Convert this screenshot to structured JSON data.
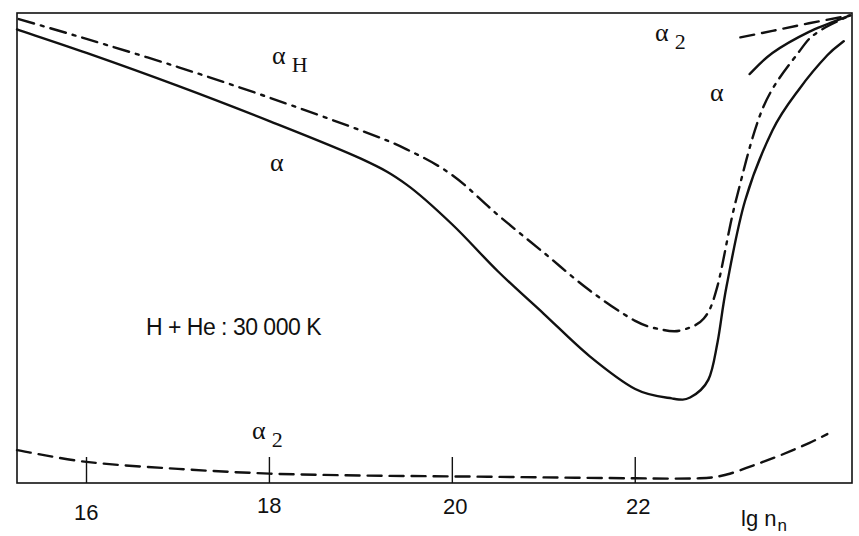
{
  "chart_data": {
    "type": "line",
    "title": "",
    "annotation": "H + He : 30 000 K",
    "xlabel": "lg n",
    "xlabel_subscript": "n",
    "ylabel": "",
    "xlim": [
      15.24,
      24.37
    ],
    "xticks": [
      16,
      18,
      20,
      22
    ],
    "ylim_note": "unlabeled y-axis; values are relative (0 = bottom axis, 1 = top frame)",
    "grid": false,
    "legend": "inline labels",
    "series": [
      {
        "name": "α_H",
        "style": "dash-dot",
        "x": [
          15.26,
          16.0,
          17.0,
          18.0,
          19.0,
          19.5,
          20.0,
          20.5,
          21.0,
          21.5,
          22.0,
          22.3,
          22.5,
          22.75,
          22.9,
          23.1,
          23.4,
          23.8,
          24.0,
          24.35
        ],
        "y": [
          0.987,
          0.945,
          0.885,
          0.82,
          0.75,
          0.71,
          0.655,
          0.57,
          0.49,
          0.41,
          0.345,
          0.326,
          0.325,
          0.35,
          0.42,
          0.6,
          0.8,
          0.92,
          0.96,
          0.995
        ]
      },
      {
        "name": "α",
        "style": "solid",
        "x": [
          15.24,
          16.0,
          17.0,
          18.0,
          19.0,
          19.5,
          20.0,
          20.5,
          21.0,
          21.5,
          22.0,
          22.4,
          22.6,
          22.8,
          22.9,
          23.0,
          23.2,
          23.5,
          23.8,
          24.1,
          24.28
        ],
        "y": [
          0.965,
          0.915,
          0.845,
          0.77,
          0.69,
          0.635,
          0.55,
          0.45,
          0.36,
          0.27,
          0.2,
          0.18,
          0.182,
          0.22,
          0.3,
          0.42,
          0.6,
          0.75,
          0.84,
          0.91,
          0.94
        ]
      },
      {
        "name": "α_2",
        "style": "dashed",
        "x": [
          15.24,
          16.0,
          17.0,
          18.0,
          19.0,
          20.0,
          21.0,
          22.0,
          22.7,
          23.0,
          23.3,
          23.6,
          23.9,
          24.1
        ],
        "y": [
          0.07,
          0.045,
          0.03,
          0.02,
          0.016,
          0.014,
          0.012,
          0.01,
          0.01,
          0.018,
          0.038,
          0.06,
          0.085,
          0.104
        ]
      },
      {
        "name": "α_2 (upper branch)",
        "style": "dashed",
        "x": [
          23.15,
          23.5,
          23.9,
          24.35
        ],
        "y": [
          0.948,
          0.962,
          0.978,
          0.995
        ]
      },
      {
        "name": "α (upper branch)",
        "style": "solid",
        "x": [
          23.25,
          23.5,
          23.9,
          24.35
        ],
        "y": [
          0.87,
          0.915,
          0.96,
          0.995
        ]
      }
    ],
    "labels": [
      {
        "text": "α",
        "sub": "H",
        "near_series": "α_H"
      },
      {
        "text": "α",
        "sub": "",
        "near_series": "α"
      },
      {
        "text": "α",
        "sub": "2",
        "near_series": "α_2"
      },
      {
        "text": "α",
        "sub": "2",
        "near_series": "α_2 (upper branch)"
      },
      {
        "text": "α",
        "sub": "",
        "near_series": "α (upper branch)"
      }
    ]
  },
  "axis": {
    "tick_labels": [
      "16",
      "18",
      "20",
      "22"
    ],
    "xlabel_main": "lg n",
    "xlabel_sub": "n"
  },
  "labels": {
    "alpha": "α",
    "sub_H": "H",
    "sub_2": "2",
    "annotation": "H + He : 30 000 K"
  }
}
